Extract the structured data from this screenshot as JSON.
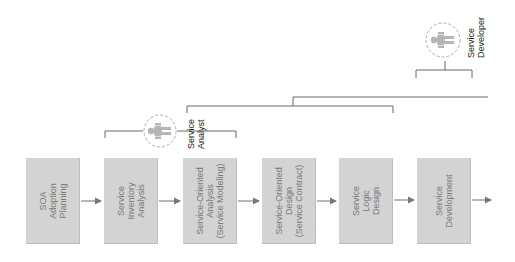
{
  "diagram": {
    "steps": [
      {
        "label": "SOA\nAdoption\nPlanning",
        "x": 26
      },
      {
        "label": "Service\nInventory\nAnalysis",
        "x": 104
      },
      {
        "label": "Service-Oriented\nAnalysis\n(Service Modeling)",
        "x": 183
      },
      {
        "label": "Service-Oriented\nDesign\n(Service Contract)",
        "x": 262
      },
      {
        "label": "Service\nLogic\nDesign",
        "x": 339
      },
      {
        "label": "Service\nDevelopment",
        "x": 417
      }
    ],
    "roles": [
      {
        "label": "Service\nAnalyst",
        "icon": "person-icon"
      },
      {
        "label": "Service\nDeveloper",
        "icon": "person-icon"
      }
    ],
    "colors": {
      "box": "#d3d3d3",
      "box_text": "#7a7a7a",
      "line": "#555555",
      "arrow": "#777777",
      "circle": "#aaaaaa",
      "person": "#b0b0b0"
    }
  }
}
